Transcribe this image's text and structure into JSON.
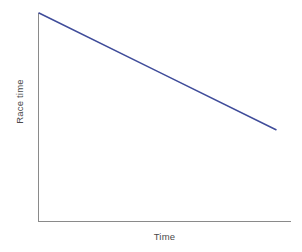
{
  "chart_data": {
    "type": "line",
    "title": "",
    "subtitle": "",
    "xlabel": "Time",
    "ylabel": "Race time",
    "grid": false,
    "legend": false,
    "legend_position": "none",
    "xlim": [
      0,
      100
    ],
    "ylim": [
      0,
      100
    ],
    "x_tick_labels": [],
    "y_tick_labels": [],
    "annotations": [],
    "series": [
      {
        "name": "Race time trend",
        "color": "#3f4c9a",
        "x": [
          0,
          50,
          100
        ],
        "y": [
          100,
          72,
          44
        ]
      }
    ]
  },
  "axes": {
    "line_color": "#8a8a8a",
    "x_axis_name": "x-axis",
    "y_axis_name": "y-axis"
  },
  "labels": {
    "y": "Race time",
    "x": "Time"
  },
  "colors": {
    "background": "#ffffff",
    "series": "#3f4c9a",
    "axis": "#8a8a8a",
    "text": "#4a4a4a"
  }
}
